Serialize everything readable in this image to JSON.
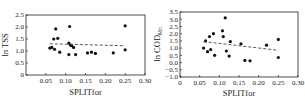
{
  "chart_data": [
    {
      "type": "scatter",
      "title": "",
      "xlabel": "SPLITfor",
      "ylabel": "ln TSS",
      "xlim": [
        0,
        0.3
      ],
      "ylim": [
        0,
        2.5
      ],
      "xticks": [
        "0.05",
        "0.10",
        "0.15",
        "0.20",
        "0.25",
        "0.30"
      ],
      "yticks": [
        "0",
        "0.5",
        "1.0",
        "1.5",
        "2.0",
        "2.5"
      ],
      "grid": false,
      "legend": null,
      "series": [
        {
          "name": "observations",
          "marker": "filled-circle",
          "points": [
            [
              0.06,
              1.12
            ],
            [
              0.065,
              1.15
            ],
            [
              0.07,
              1.5
            ],
            [
              0.072,
              1.07
            ],
            [
              0.075,
              1.92
            ],
            [
              0.08,
              1.53
            ],
            [
              0.085,
              0.95
            ],
            [
              0.108,
              1.33
            ],
            [
              0.108,
              0.85
            ],
            [
              0.11,
              2.02
            ],
            [
              0.112,
              1.25
            ],
            [
              0.115,
              1.22
            ],
            [
              0.12,
              1.15
            ],
            [
              0.125,
              0.85
            ],
            [
              0.155,
              0.92
            ],
            [
              0.165,
              0.95
            ],
            [
              0.175,
              0.9
            ],
            [
              0.22,
              0.92
            ],
            [
              0.25,
              2.05
            ],
            [
              0.25,
              1.05
            ]
          ]
        },
        {
          "name": "trend",
          "style": "dashed-line",
          "points": [
            [
              0.06,
              1.3
            ],
            [
              0.25,
              1.22
            ]
          ]
        }
      ]
    },
    {
      "type": "scatter",
      "title": "",
      "xlabel": "SPLITfor",
      "ylabel": "ln COD",
      "ylabel_subscript": "Mn",
      "xlim": [
        0,
        0.3
      ],
      "ylim": [
        -1.0,
        3.5
      ],
      "xticks": [
        "0",
        "0.05",
        "0.10",
        "0.15",
        "0.20",
        "0.25",
        "0.30"
      ],
      "yticks": [
        "-1.0",
        "-0.5",
        "0.0",
        "0.5",
        "1.0",
        "1.5",
        "2.0",
        "2.5",
        "3.0",
        "3.5"
      ],
      "grid": false,
      "legend": null,
      "series": [
        {
          "name": "observations",
          "marker": "filled-circle",
          "points": [
            [
              0.06,
              1.0
            ],
            [
              0.065,
              1.5
            ],
            [
              0.07,
              0.75
            ],
            [
              0.075,
              1.8
            ],
            [
              0.078,
              0.9
            ],
            [
              0.085,
              2.0
            ],
            [
              0.088,
              0.5
            ],
            [
              0.108,
              2.2
            ],
            [
              0.11,
              1.8
            ],
            [
              0.115,
              3.1
            ],
            [
              0.118,
              0.8
            ],
            [
              0.125,
              0.45
            ],
            [
              0.128,
              1.45
            ],
            [
              0.155,
              1.3
            ],
            [
              0.165,
              0.15
            ],
            [
              0.178,
              0.12
            ],
            [
              0.22,
              1.2
            ],
            [
              0.25,
              1.6
            ],
            [
              0.25,
              0.35
            ]
          ]
        },
        {
          "name": "trend",
          "style": "dashed-line",
          "points": [
            [
              0.06,
              1.45
            ],
            [
              0.25,
              0.85
            ]
          ]
        }
      ]
    }
  ],
  "labels": {
    "left_ylabel": "ln TSS",
    "left_xlabel": "SPLITfor",
    "right_ylabel": "ln COD",
    "right_ylabel_sub": "Mn",
    "right_xlabel": "SPLITfor"
  }
}
